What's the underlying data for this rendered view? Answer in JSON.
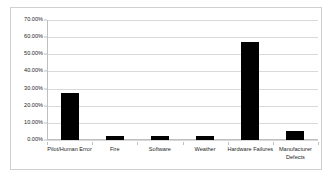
{
  "chart_data": {
    "type": "bar",
    "title": "",
    "subtitle": "",
    "xlabel": "",
    "ylabel": "",
    "categories": [
      "Pilot/Human Error",
      "Fire",
      "Software",
      "Weather",
      "Hardware Failures",
      "Manufacturer Defects"
    ],
    "values": [
      0.275,
      0.025,
      0.025,
      0.025,
      0.57,
      0.055
    ],
    "value_labels": [
      "27.50%",
      "2.50%",
      "2.50%",
      "2.50%",
      "57.00%",
      "5.50%"
    ],
    "ylim": [
      0,
      0.7
    ],
    "y_ticks": [
      0,
      0.1,
      0.2,
      0.3,
      0.4,
      0.5,
      0.6,
      0.7
    ],
    "y_tick_labels": [
      "0.00%",
      "10.00%",
      "20.00%",
      "30.00%",
      "40.00%",
      "50.00%",
      "60.00%",
      "70.00%"
    ],
    "grid": "horizontal",
    "legend": "none",
    "series_color": "#000000",
    "gridline_color": "#d9d9d9",
    "axis_color": "#bfbfbf",
    "background_color": "#ffffff",
    "border_color": "#d0d0d0"
  }
}
